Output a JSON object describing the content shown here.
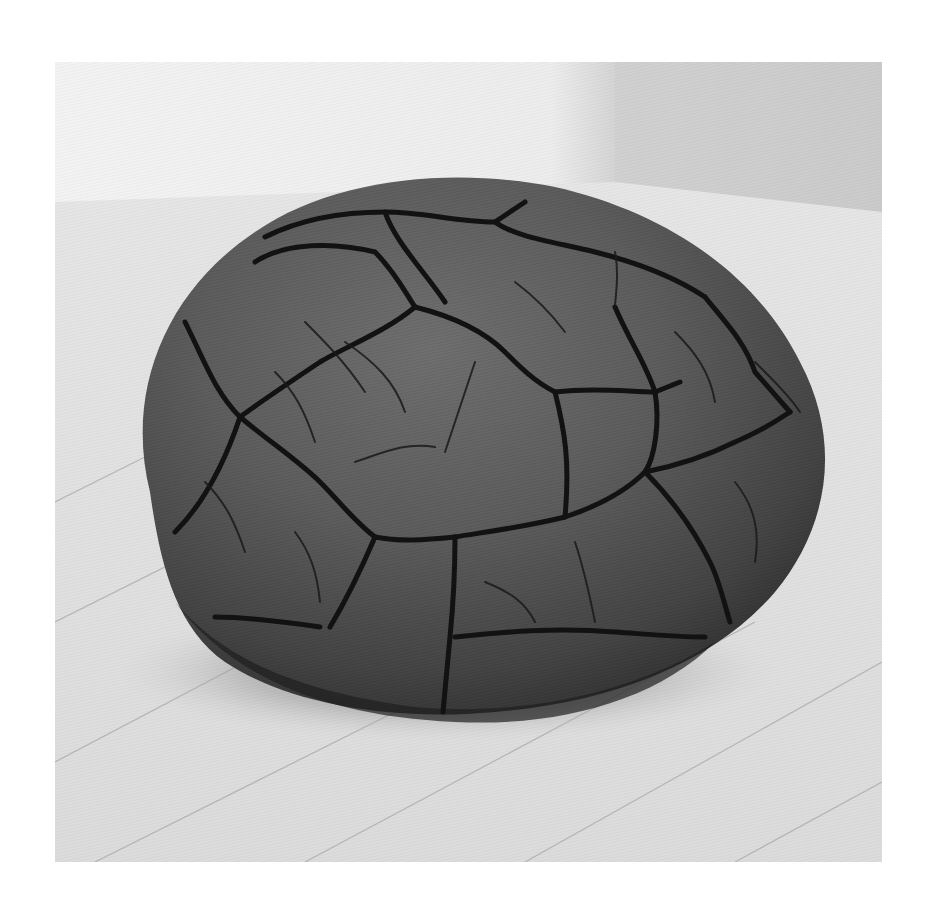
{
  "image": {
    "subject": "cracked clay boulder sculpture on wooden floor",
    "frame": {
      "x": 55,
      "y": 62,
      "width": 827,
      "height": 800
    },
    "colors": {
      "page_background": "#ffffff",
      "wall_light": "#f1f1f1",
      "wall_shadow": "#c9c9c9",
      "floor": "#e2e2e2",
      "floor_line": "#a8a8a8",
      "boulder_light": "#6e6e6e",
      "boulder_mid": "#565656",
      "boulder_dark": "#2f2f2f",
      "crack": "#141414",
      "cast_shadow": "#8a8a8a"
    }
  }
}
